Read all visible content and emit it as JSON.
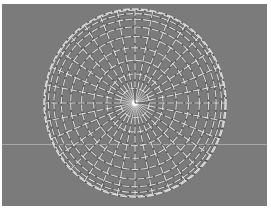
{
  "viewport": {
    "name": "3D viewport",
    "view": "top",
    "object": "UV sphere",
    "mesh": {
      "rings": 10,
      "segments": 32
    },
    "colors": {
      "background": "#7b7b7b",
      "wire": "#e6e6e6",
      "wire_shadow": "#4a4a4a",
      "horizon": "#a8a8a8",
      "pivot": "#ffffff"
    }
  }
}
